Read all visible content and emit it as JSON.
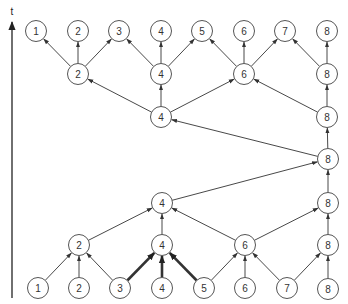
{
  "diagram": {
    "axis": {
      "label": "t",
      "x": 12,
      "y_bottom": 298,
      "y_top": 22
    },
    "node_radius": 10.5,
    "nodes": [
      {
        "id": "r0n1",
        "label": "1",
        "x": 38,
        "y": 288
      },
      {
        "id": "r0n2",
        "label": "2",
        "x": 79,
        "y": 288
      },
      {
        "id": "r0n3",
        "label": "3",
        "x": 120,
        "y": 288
      },
      {
        "id": "r0n4",
        "label": "4",
        "x": 162,
        "y": 288
      },
      {
        "id": "r0n5",
        "label": "5",
        "x": 204,
        "y": 288
      },
      {
        "id": "r0n6",
        "label": "6",
        "x": 245,
        "y": 288
      },
      {
        "id": "r0n7",
        "label": "7",
        "x": 287,
        "y": 288
      },
      {
        "id": "r0n8",
        "label": "8",
        "x": 328,
        "y": 289
      },
      {
        "id": "r1n2",
        "label": "2",
        "x": 79,
        "y": 245
      },
      {
        "id": "r1n4",
        "label": "4",
        "x": 162,
        "y": 245
      },
      {
        "id": "r1n6",
        "label": "6",
        "x": 245,
        "y": 245
      },
      {
        "id": "r1n8",
        "label": "8",
        "x": 328,
        "y": 245
      },
      {
        "id": "r2n4",
        "label": "4",
        "x": 162,
        "y": 203
      },
      {
        "id": "r2n8",
        "label": "8",
        "x": 328,
        "y": 203
      },
      {
        "id": "r3n8",
        "label": "8",
        "x": 328,
        "y": 159
      },
      {
        "id": "r4n4",
        "label": "4",
        "x": 161,
        "y": 117
      },
      {
        "id": "r4n8",
        "label": "8",
        "x": 327,
        "y": 117
      },
      {
        "id": "r5n2",
        "label": "2",
        "x": 78,
        "y": 74
      },
      {
        "id": "r5n4",
        "label": "4",
        "x": 161,
        "y": 74
      },
      {
        "id": "r5n6",
        "label": "6",
        "x": 244,
        "y": 74
      },
      {
        "id": "r5n8",
        "label": "8",
        "x": 327,
        "y": 74
      },
      {
        "id": "r6n1",
        "label": "1",
        "x": 36,
        "y": 31
      },
      {
        "id": "r6n2",
        "label": "2",
        "x": 78,
        "y": 31
      },
      {
        "id": "r6n3",
        "label": "3",
        "x": 119,
        "y": 31
      },
      {
        "id": "r6n4",
        "label": "4",
        "x": 161,
        "y": 31
      },
      {
        "id": "r6n5",
        "label": "5",
        "x": 202,
        "y": 31
      },
      {
        "id": "r6n6",
        "label": "6",
        "x": 244,
        "y": 31
      },
      {
        "id": "r6n7",
        "label": "7",
        "x": 285,
        "y": 31
      },
      {
        "id": "r6n8",
        "label": "8",
        "x": 327,
        "y": 31
      }
    ],
    "edges": [
      {
        "from": "r0n1",
        "to": "r1n2"
      },
      {
        "from": "r0n2",
        "to": "r1n2"
      },
      {
        "from": "r0n3",
        "to": "r1n2"
      },
      {
        "from": "r0n3",
        "to": "r1n4",
        "bold": true
      },
      {
        "from": "r0n4",
        "to": "r1n4",
        "bold": true
      },
      {
        "from": "r0n5",
        "to": "r1n4",
        "bold": true
      },
      {
        "from": "r0n5",
        "to": "r1n6"
      },
      {
        "from": "r0n6",
        "to": "r1n6"
      },
      {
        "from": "r0n7",
        "to": "r1n6"
      },
      {
        "from": "r0n7",
        "to": "r1n8"
      },
      {
        "from": "r0n8",
        "to": "r1n8"
      },
      {
        "from": "r1n2",
        "to": "r2n4"
      },
      {
        "from": "r1n4",
        "to": "r2n4"
      },
      {
        "from": "r1n6",
        "to": "r2n4"
      },
      {
        "from": "r1n6",
        "to": "r2n8"
      },
      {
        "from": "r1n8",
        "to": "r2n8"
      },
      {
        "from": "r2n4",
        "to": "r3n8"
      },
      {
        "from": "r2n8",
        "to": "r3n8"
      },
      {
        "from": "r3n8",
        "to": "r4n4"
      },
      {
        "from": "r3n8",
        "to": "r4n8"
      },
      {
        "from": "r4n4",
        "to": "r5n2"
      },
      {
        "from": "r4n4",
        "to": "r5n4"
      },
      {
        "from": "r4n4",
        "to": "r5n6"
      },
      {
        "from": "r4n8",
        "to": "r5n6"
      },
      {
        "from": "r4n8",
        "to": "r5n8"
      },
      {
        "from": "r5n2",
        "to": "r6n1"
      },
      {
        "from": "r5n2",
        "to": "r6n2"
      },
      {
        "from": "r5n2",
        "to": "r6n3"
      },
      {
        "from": "r5n4",
        "to": "r6n3"
      },
      {
        "from": "r5n4",
        "to": "r6n4"
      },
      {
        "from": "r5n4",
        "to": "r6n5"
      },
      {
        "from": "r5n6",
        "to": "r6n5"
      },
      {
        "from": "r5n6",
        "to": "r6n6"
      },
      {
        "from": "r5n6",
        "to": "r6n7"
      },
      {
        "from": "r5n8",
        "to": "r6n7"
      },
      {
        "from": "r5n8",
        "to": "r6n8"
      }
    ]
  }
}
